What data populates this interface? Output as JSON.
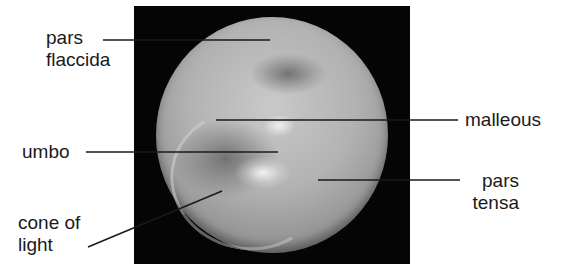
{
  "diagram": {
    "labels": {
      "pars_flaccida": [
        "pars",
        "flaccida"
      ],
      "malleous": "malleous",
      "umbo": "umbo",
      "pars_tensa": [
        "pars",
        "tensa"
      ],
      "cone_of_light": [
        "cone of",
        "light"
      ]
    },
    "colors": {
      "frame": "#050505",
      "membrane": "#b2b2b2",
      "leader_line": "#1a1a1a",
      "text": "#1a1a1a"
    },
    "leader_lines": [
      {
        "name": "pars-flaccida",
        "x1": 103,
        "y1": 40,
        "x2": 270,
        "y2": 40
      },
      {
        "name": "malleous",
        "x1": 216,
        "y1": 120,
        "x2": 458,
        "y2": 120
      },
      {
        "name": "umbo",
        "x1": 86,
        "y1": 152,
        "x2": 278,
        "y2": 152
      },
      {
        "name": "pars-tensa",
        "x1": 318,
        "y1": 180,
        "x2": 460,
        "y2": 180
      },
      {
        "name": "cone-of-light",
        "x1": 88,
        "y1": 247,
        "x2": 222,
        "y2": 191
      }
    ]
  }
}
